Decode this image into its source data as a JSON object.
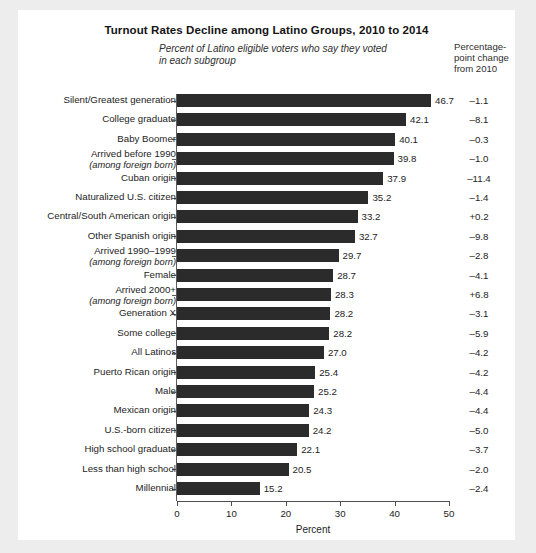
{
  "title": "Turnout Rates Decline among Latino Groups, 2010 to 2014",
  "subtitle": "Percent of Latino eligible voters who say they voted in each subgroup",
  "change_column_header": "Percentage-point change from 2010",
  "axis_title": "Percent",
  "colors": {
    "bar": "#2b2b2b",
    "card": "#ffffff",
    "page": "#ededed",
    "text": "#1d1d1d"
  },
  "chart_data": {
    "type": "bar",
    "orientation": "horizontal",
    "title": "Turnout Rates Decline among Latino Groups, 2010 to 2014",
    "subtitle": "Percent of Latino eligible voters who say they voted in each subgroup",
    "xlabel": "Percent",
    "ylabel": "",
    "xlim": [
      0,
      50
    ],
    "xticks": [
      0,
      10,
      20,
      30,
      40,
      50
    ],
    "grid": false,
    "legend": false,
    "value_label_suffix": "",
    "extra_column_label": "Percentage-point change from 2010",
    "categories": [
      "Silent/Greatest generation",
      "College graduate",
      "Baby Boomer",
      "Arrived before 1990",
      "Cuban origin",
      "Naturalized U.S. citizen",
      "Central/South American origin",
      "Other Spanish origin",
      "Arrived 1990–1999",
      "Female",
      "Arrived 2000+",
      "Generation X",
      "Some college",
      "All Latinos",
      "Puerto Rican origin",
      "Male",
      "Mexican origin",
      "U.S.-born citizen",
      "High school graduate",
      "Less than high school",
      "Millennial"
    ],
    "category_sublabels": [
      "",
      "",
      "",
      "(among foreign born)",
      "",
      "",
      "",
      "",
      "(among foreign born)",
      "",
      "(among foreign born)",
      "",
      "",
      "",
      "",
      "",
      "",
      "",
      "",
      "",
      ""
    ],
    "values": [
      46.7,
      42.1,
      40.1,
      39.8,
      37.9,
      35.2,
      33.2,
      32.7,
      29.7,
      28.7,
      28.3,
      28.2,
      28.0,
      27.0,
      25.4,
      25.2,
      24.3,
      24.2,
      22.1,
      20.5,
      15.2
    ],
    "value_labels": [
      "46.7",
      "42.1",
      "40.1",
      "39.8",
      "37.9",
      "35.2",
      "33.2",
      "32.7",
      "29.7",
      "28.7",
      "28.3",
      "28.2",
      "28.2",
      "27.0",
      "25.4",
      "25.2",
      "24.3",
      "24.2",
      "22.1",
      "20.5",
      "15.2"
    ],
    "changes": [
      -1.1,
      -8.1,
      -0.3,
      -1.0,
      -11.4,
      -1.4,
      0.2,
      -9.8,
      -2.8,
      -4.1,
      6.8,
      -3.1,
      -5.9,
      -4.2,
      -4.2,
      -4.4,
      -4.4,
      -5.0,
      -3.7,
      -2.0,
      -2.4
    ],
    "change_labels": [
      "–1.1",
      "–8.1",
      "–0.3",
      "–1.0",
      "–11.4",
      "–1.4",
      "+0.2",
      "–9.8",
      "–2.8",
      "–4.1",
      "+6.8",
      "–3.1",
      "–5.9",
      "–4.2",
      "–4.2",
      "–4.4",
      "–4.4",
      "–5.0",
      "–3.7",
      "–2.0",
      "–2.4"
    ]
  },
  "xtick_labels": [
    "0",
    "10",
    "20",
    "30",
    "40",
    "50"
  ]
}
